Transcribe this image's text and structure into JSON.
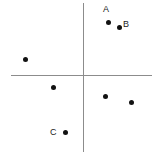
{
  "figure": {
    "type": "scatter-plot",
    "width": 159,
    "height": 156,
    "background": "#ffffff"
  },
  "axes": {
    "origin_x": 83,
    "origin_y": 75,
    "color": "#8c8c8c",
    "x_axis": {
      "name": "horizontal-axis",
      "start_x": 11,
      "end_x": 152,
      "y": 75
    },
    "y_axis": {
      "name": "vertical-axis",
      "x": 83,
      "start_y": 3,
      "end_y": 152
    }
  },
  "chart_data": {
    "type": "scatter",
    "title": "",
    "xlabel": "",
    "ylabel": "",
    "grid": false,
    "legend": "none",
    "axis_origin_px": [
      83,
      75
    ],
    "xlim": [
      -83,
      76
    ],
    "ylim": [
      -81,
      75
    ],
    "point_color": "#121212",
    "points": [
      {
        "label": "A",
        "px": [
          108,
          22
        ],
        "value": [
          25,
          53
        ],
        "quadrant": "I"
      },
      {
        "label": "B",
        "px": [
          119,
          27
        ],
        "value": [
          36,
          48
        ],
        "quadrant": "I"
      },
      {
        "label": "",
        "px": [
          25,
          59
        ],
        "value": [
          -58,
          16
        ],
        "quadrant": "II"
      },
      {
        "label": "",
        "px": [
          53,
          87
        ],
        "value": [
          -30,
          -12
        ],
        "quadrant": "III"
      },
      {
        "label": "C",
        "px": [
          65,
          132
        ],
        "value": [
          -18,
          -57
        ],
        "quadrant": "III"
      },
      {
        "label": "",
        "px": [
          105,
          96
        ],
        "value": [
          22,
          -21
        ],
        "quadrant": "IV"
      },
      {
        "label": "",
        "px": [
          131,
          102
        ],
        "value": [
          48,
          -27
        ],
        "quadrant": "IV"
      }
    ],
    "labels": [
      {
        "text": "A",
        "px": [
          103,
          5
        ],
        "anchor_point_index": 0
      },
      {
        "text": "B",
        "px": [
          123,
          20
        ],
        "anchor_point_index": 1
      },
      {
        "text": "C",
        "px": [
          50,
          128
        ],
        "anchor_point_index": 4
      }
    ]
  }
}
